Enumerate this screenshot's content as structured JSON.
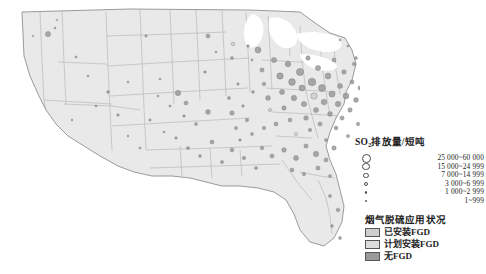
{
  "figure": {
    "type": "thematic-map",
    "region": "United States (contiguous)",
    "background_color": "#ffffff",
    "state_fill_color": "#e9e9e9",
    "state_border_color": "#b4b4b4",
    "coast_border_color": "#8d8d8d"
  },
  "size_legend": {
    "title_main": "SO",
    "title_sub": "2",
    "title_rest": "排放量/短吨",
    "title_full": "SO2排放量/短吨",
    "items": [
      {
        "label": "25 000~60 000",
        "diameter_px": 9.0
      },
      {
        "label": "15 000~24 999",
        "diameter_px": 7.2
      },
      {
        "label": "7 000~14 999",
        "diameter_px": 5.6
      },
      {
        "label": "3 000~6 999",
        "diameter_px": 4.0
      },
      {
        "label": "1 000~2 999",
        "diameter_px": 2.8
      },
      {
        "label": "1~999",
        "diameter_px": 1.6
      }
    ]
  },
  "fgd_legend": {
    "title": "烟气脱硫应用状况",
    "items": [
      {
        "label": "已安装FGD",
        "color": "#cfcfcf"
      },
      {
        "label": "计划安装FGD",
        "color": "#dcdcdc"
      },
      {
        "label": "无FGD",
        "color": "#9a9a9a"
      }
    ]
  },
  "chart_data": {
    "type": "scatter",
    "title": "SO2排放量/短吨",
    "xlabel": "",
    "ylabel": "",
    "legend_position": "right",
    "grid": false,
    "size_classes": [
      "25 000~60 000",
      "15 000~24 999",
      "7 000~14 999",
      "3 000~6 999",
      "1 000~2 999",
      "1~999"
    ],
    "color_classes": [
      "已安装FGD",
      "计划安装FGD",
      "无FGD"
    ],
    "points": [
      [
        48,
        34,
        5.2,
        2
      ],
      [
        55,
        28,
        2.0,
        2
      ],
      [
        57,
        20,
        2.0,
        0
      ],
      [
        33,
        36,
        1.6,
        2
      ],
      [
        76,
        57,
        2.2,
        2
      ],
      [
        160,
        79,
        2.0,
        2
      ],
      [
        118,
        115,
        2.6,
        2
      ],
      [
        178,
        93,
        5.4,
        2
      ],
      [
        186,
        103,
        4.0,
        2
      ],
      [
        205,
        72,
        2.6,
        2
      ],
      [
        208,
        112,
        4.8,
        2
      ],
      [
        146,
        36,
        2.4,
        2
      ],
      [
        128,
        82,
        1.8,
        2
      ],
      [
        208,
        36,
        4.0,
        2
      ],
      [
        216,
        52,
        2.0,
        2
      ],
      [
        232,
        58,
        3.0,
        2
      ],
      [
        233,
        44,
        3.6,
        0
      ],
      [
        238,
        84,
        2.4,
        2
      ],
      [
        248,
        46,
        2.6,
        2
      ],
      [
        252,
        60,
        2.2,
        2
      ],
      [
        229,
        98,
        3.2,
        2
      ],
      [
        232,
        113,
        4.4,
        2
      ],
      [
        236,
        128,
        3.2,
        2
      ],
      [
        243,
        106,
        2.6,
        2
      ],
      [
        247,
        120,
        3.4,
        2
      ],
      [
        253,
        92,
        2.8,
        2
      ],
      [
        258,
        50,
        6.0,
        2
      ],
      [
        262,
        70,
        4.2,
        2
      ],
      [
        264,
        84,
        3.6,
        2
      ],
      [
        268,
        98,
        4.8,
        2
      ],
      [
        270,
        110,
        3.2,
        0
      ],
      [
        274,
        60,
        5.2,
        2
      ],
      [
        276,
        124,
        4.0,
        2
      ],
      [
        280,
        76,
        6.4,
        2
      ],
      [
        282,
        92,
        5.0,
        2
      ],
      [
        284,
        108,
        4.4,
        2
      ],
      [
        288,
        64,
        5.6,
        2
      ],
      [
        290,
        120,
        3.8,
        2
      ],
      [
        292,
        82,
        6.8,
        2
      ],
      [
        294,
        98,
        5.4,
        2
      ],
      [
        296,
        134,
        3.2,
        1
      ],
      [
        300,
        72,
        7.2,
        2
      ],
      [
        302,
        88,
        6.0,
        2
      ],
      [
        304,
        104,
        5.2,
        2
      ],
      [
        306,
        118,
        4.6,
        2
      ],
      [
        308,
        58,
        4.4,
        2
      ],
      [
        310,
        130,
        3.4,
        2
      ],
      [
        312,
        82,
        7.6,
        2
      ],
      [
        314,
        96,
        6.4,
        0
      ],
      [
        316,
        110,
        5.0,
        2
      ],
      [
        318,
        68,
        5.2,
        2
      ],
      [
        320,
        124,
        4.2,
        2
      ],
      [
        322,
        88,
        6.8,
        2
      ],
      [
        324,
        102,
        5.6,
        2
      ],
      [
        326,
        140,
        3.0,
        2
      ],
      [
        328,
        76,
        5.8,
        2
      ],
      [
        330,
        114,
        4.8,
        2
      ],
      [
        332,
        94,
        6.2,
        2
      ],
      [
        334,
        60,
        4.0,
        2
      ],
      [
        336,
        128,
        3.8,
        2
      ],
      [
        338,
        104,
        5.4,
        2
      ],
      [
        340,
        86,
        5.0,
        2
      ],
      [
        342,
        118,
        4.2,
        2
      ],
      [
        344,
        72,
        4.6,
        2
      ],
      [
        346,
        96,
        5.8,
        2
      ],
      [
        348,
        136,
        3.2,
        2
      ],
      [
        350,
        110,
        4.4,
        2
      ],
      [
        352,
        82,
        4.0,
        2
      ],
      [
        354,
        64,
        3.6,
        2
      ],
      [
        356,
        100,
        4.8,
        2
      ],
      [
        358,
        124,
        3.4,
        2
      ],
      [
        360,
        88,
        4.2,
        2
      ],
      [
        364,
        76,
        3.8,
        2
      ],
      [
        368,
        94,
        4.0,
        2
      ],
      [
        372,
        68,
        3.2,
        2
      ],
      [
        376,
        84,
        3.6,
        2
      ],
      [
        380,
        104,
        3.0,
        2
      ],
      [
        384,
        72,
        2.8,
        2
      ],
      [
        388,
        90,
        3.4,
        2
      ],
      [
        392,
        78,
        2.6,
        2
      ],
      [
        262,
        148,
        3.6,
        2
      ],
      [
        272,
        156,
        4.0,
        2
      ],
      [
        284,
        150,
        4.6,
        2
      ],
      [
        296,
        158,
        5.0,
        2
      ],
      [
        306,
        146,
        4.2,
        2
      ],
      [
        316,
        154,
        5.4,
        2
      ],
      [
        326,
        160,
        4.0,
        2
      ],
      [
        334,
        148,
        4.4,
        2
      ],
      [
        292,
        170,
        3.8,
        2
      ],
      [
        304,
        174,
        3.4,
        2
      ],
      [
        318,
        168,
        4.2,
        2
      ],
      [
        330,
        176,
        3.0,
        2
      ],
      [
        256,
        168,
        3.0,
        2
      ],
      [
        244,
        158,
        3.4,
        2
      ],
      [
        232,
        150,
        3.8,
        2
      ],
      [
        222,
        162,
        3.2,
        2
      ],
      [
        212,
        142,
        4.0,
        2
      ],
      [
        200,
        156,
        2.8,
        2
      ],
      [
        188,
        148,
        3.2,
        2
      ],
      [
        176,
        138,
        2.6,
        2
      ],
      [
        330,
        196,
        3.2,
        2
      ],
      [
        338,
        210,
        3.6,
        2
      ],
      [
        332,
        226,
        2.8,
        2
      ],
      [
        340,
        238,
        3.0,
        2
      ],
      [
        150,
        120,
        2.4,
        2
      ],
      [
        164,
        132,
        2.0,
        2
      ],
      [
        140,
        148,
        2.2,
        2
      ],
      [
        128,
        136,
        1.8,
        2
      ],
      [
        108,
        92,
        2.8,
        2
      ],
      [
        96,
        106,
        2.2,
        2
      ],
      [
        88,
        76,
        2.0,
        2
      ],
      [
        72,
        120,
        1.8,
        2
      ],
      [
        196,
        124,
        3.0,
        2
      ],
      [
        184,
        116,
        2.6,
        2
      ],
      [
        170,
        106,
        2.2,
        2
      ],
      [
        158,
        96,
        2.0,
        2
      ],
      [
        356,
        58,
        3.0,
        2
      ],
      [
        362,
        50,
        2.4,
        2
      ],
      [
        348,
        46,
        2.2,
        2
      ],
      [
        340,
        40,
        2.0,
        2
      ],
      [
        252,
        134,
        3.0,
        2
      ],
      [
        240,
        140,
        2.6,
        2
      ],
      [
        264,
        128,
        3.4,
        2
      ]
    ]
  }
}
